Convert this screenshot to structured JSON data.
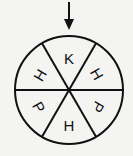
{
  "diagram": {
    "type": "spinner",
    "pointer": "arrow-down",
    "sectors": [
      {
        "label": "K",
        "position": "top",
        "rotation": 0
      },
      {
        "label": "H",
        "position": "upper-right",
        "rotation": 60
      },
      {
        "label": "P",
        "position": "lower-right",
        "rotation": 120
      },
      {
        "label": "H",
        "position": "bottom",
        "rotation": 0
      },
      {
        "label": "P",
        "position": "lower-left",
        "rotation": 60
      },
      {
        "label": "H",
        "position": "upper-left",
        "rotation": -60
      }
    ],
    "colors": {
      "stroke": "#111111",
      "background": "#f4f4f2"
    }
  }
}
